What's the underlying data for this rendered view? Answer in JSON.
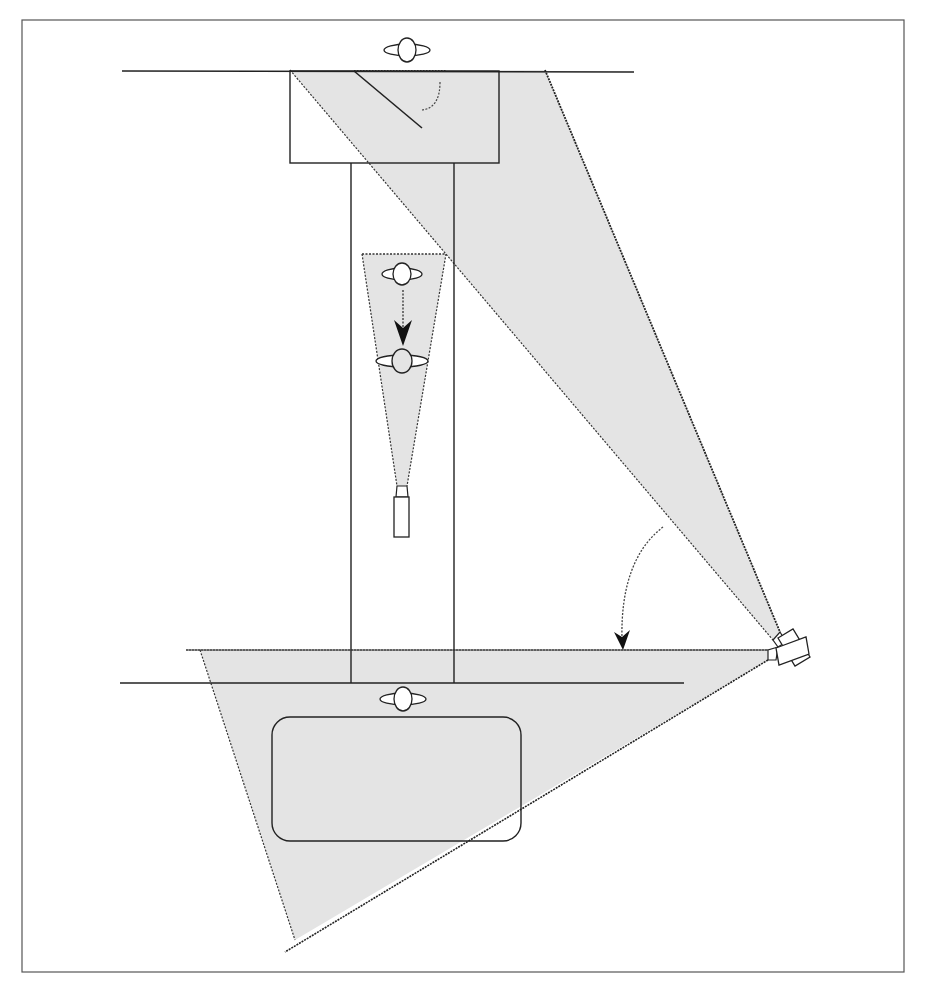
{
  "diagram": {
    "title": "",
    "colors": {
      "line": "#2a2a2a",
      "fill": "#e4e4e4",
      "frame": "#555555",
      "background": "#ffffff"
    },
    "elements": [
      {
        "id": "frame",
        "type": "border"
      },
      {
        "id": "top-wall",
        "type": "line"
      },
      {
        "id": "mirror-box",
        "type": "rect"
      },
      {
        "id": "mirror-surface",
        "type": "diagonal-line"
      },
      {
        "id": "corridor",
        "type": "rect"
      },
      {
        "id": "person-top",
        "type": "person-icon"
      },
      {
        "id": "person-walking-start",
        "type": "person-icon"
      },
      {
        "id": "person-walking-end",
        "type": "person-icon"
      },
      {
        "id": "walk-arrow",
        "type": "dotted-arrow"
      },
      {
        "id": "small-camera",
        "type": "camera-icon"
      },
      {
        "id": "small-camera-cone",
        "type": "field-of-view"
      },
      {
        "id": "main-camera",
        "type": "camera-icon"
      },
      {
        "id": "upper-view-cone",
        "type": "field-of-view"
      },
      {
        "id": "lower-view-cone",
        "type": "field-of-view"
      },
      {
        "id": "pan-arrow",
        "type": "curved-dotted-arrow"
      },
      {
        "id": "lower-wall-1",
        "type": "line"
      },
      {
        "id": "lower-wall-2",
        "type": "line"
      },
      {
        "id": "person-table",
        "type": "person-icon"
      },
      {
        "id": "table",
        "type": "rounded-rect"
      }
    ]
  }
}
